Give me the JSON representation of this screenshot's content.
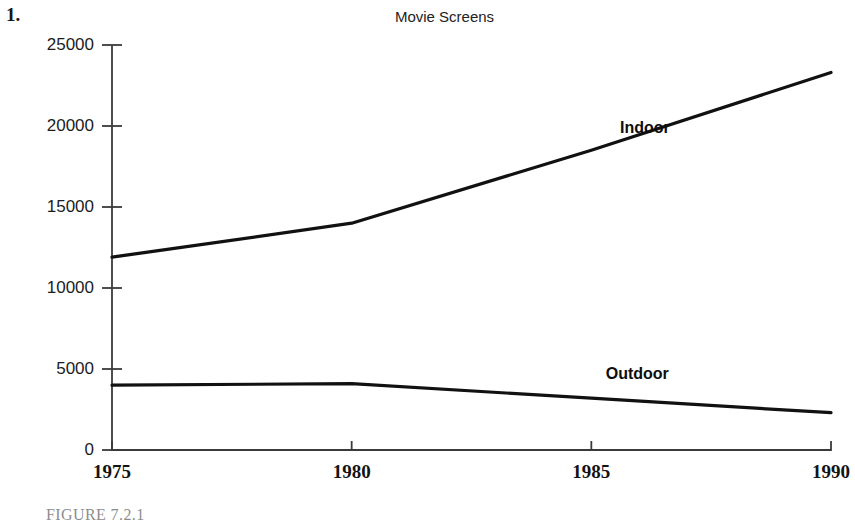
{
  "problem": {
    "number": "1."
  },
  "caption": {
    "text": "FIGURE 7.2.1"
  },
  "chart_data": {
    "type": "line",
    "title": "Movie Screens",
    "xlabel": "",
    "ylabel": "",
    "x": [
      1975,
      1980,
      1985,
      1990
    ],
    "xtick_labels": [
      "1975",
      "1980",
      "1985",
      "1990"
    ],
    "xlim": [
      1975,
      1990
    ],
    "ylim": [
      0,
      25000
    ],
    "ytick_labels": [
      "0",
      "5000",
      "10000",
      "15000",
      "20000",
      "25000"
    ],
    "ytick_values": [
      0,
      5000,
      10000,
      15000,
      20000,
      25000
    ],
    "grid": false,
    "legend_position": "inline-annotation",
    "line_color": "#111111",
    "axis_color": "#3a3a3a",
    "series": [
      {
        "name": "Indoor",
        "values": [
          11900,
          14000,
          18500,
          23300
        ],
        "annotation": "Indoor"
      },
      {
        "name": "Outdoor",
        "values": [
          4000,
          4100,
          3200,
          2300
        ],
        "annotation": "Outdoor"
      }
    ],
    "annotations": [
      {
        "text": "Indoor",
        "x": 1985.6,
        "y": 19800
      },
      {
        "text": "Outdoor",
        "x": 1985.3,
        "y": 4600
      }
    ]
  }
}
